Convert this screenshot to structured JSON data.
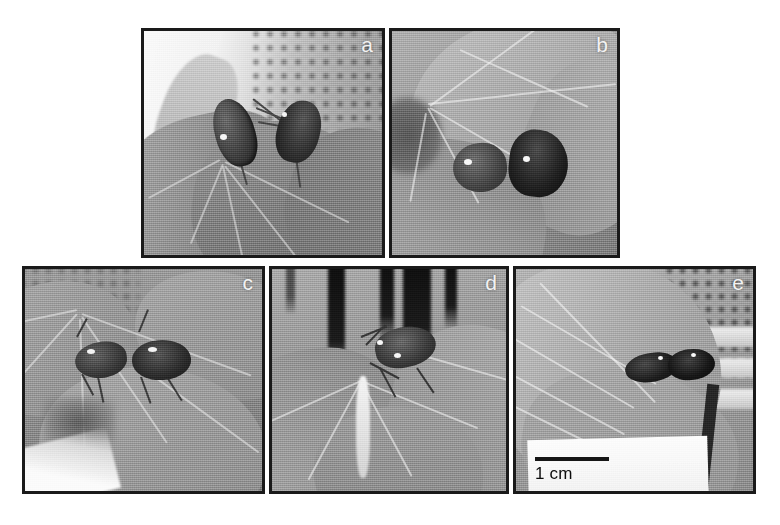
{
  "figure": {
    "background_color": "#ffffff",
    "border_color": "#1a1a1a",
    "label_color": "#f2f2f2",
    "panel_count": 5,
    "panels": [
      {
        "id": "a",
        "label": "a",
        "row": "top",
        "position": {
          "left": 141,
          "top": 28,
          "width": 244,
          "height": 230
        },
        "subject": "two stink bugs mating on a soybean leaf against bright sky",
        "scale_bar": false
      },
      {
        "id": "b",
        "label": "b",
        "row": "top",
        "position": {
          "left": 389,
          "top": 28,
          "width": 231,
          "height": 230
        },
        "subject": "two stink bugs on the upper surface of a leaf",
        "scale_bar": false
      },
      {
        "id": "c",
        "label": "c",
        "row": "bottom",
        "position": {
          "left": 22,
          "top": 266,
          "width": 243,
          "height": 228
        },
        "subject": "pair of bugs resting along a leaf vein",
        "scale_bar": false
      },
      {
        "id": "d",
        "label": "d",
        "row": "bottom",
        "position": {
          "left": 269,
          "top": 266,
          "width": 240,
          "height": 228
        },
        "subject": "bug at the junction of leaflets with dark background stripes",
        "scale_bar": false
      },
      {
        "id": "e",
        "label": "e",
        "row": "bottom",
        "position": {
          "left": 513,
          "top": 266,
          "width": 243,
          "height": 228
        },
        "subject": "two dark bugs on a leaf in front of a mesh cage",
        "scale_bar": true
      }
    ],
    "scale_bar": {
      "label": "1 cm",
      "length_px": 74,
      "color": "#1a1a1a",
      "in_panel": "e"
    }
  }
}
